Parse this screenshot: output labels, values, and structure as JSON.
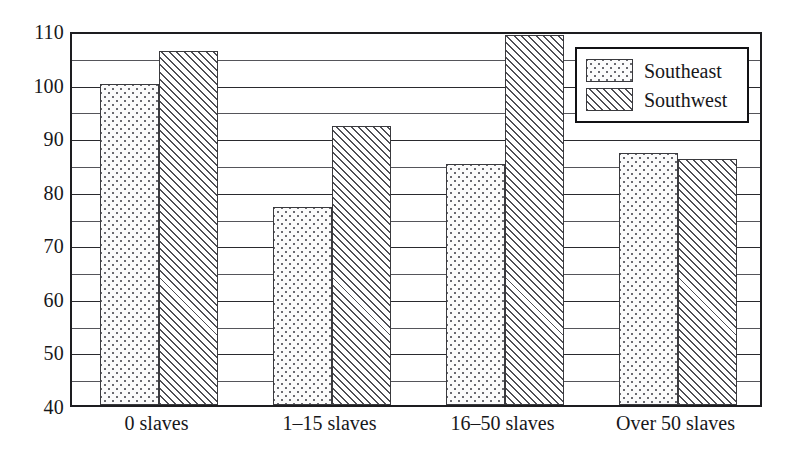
{
  "chart_data": {
    "type": "bar",
    "title": "",
    "subtitle": "",
    "xlabel": "",
    "ylabel": "",
    "ylim": [
      40,
      110
    ],
    "y_major_ticks": [
      40,
      50,
      60,
      70,
      80,
      90,
      100,
      110
    ],
    "y_minor_ticks": [
      45,
      55,
      65,
      75,
      85,
      95,
      105
    ],
    "y_tick_labels": [
      "40",
      "50",
      "60",
      "70",
      "80",
      "90",
      "100",
      "110"
    ],
    "grid": true,
    "legend_position": "top-right",
    "categories": [
      "0 slaves",
      "1–15 slaves",
      "16–50 slaves",
      "Over 50 slaves"
    ],
    "series": [
      {
        "name": "Southeast",
        "pattern": "dotted",
        "values": [
          100,
          77,
          85,
          87
        ]
      },
      {
        "name": "Southwest",
        "pattern": "diagonal-hatch",
        "values": [
          106,
          92,
          109,
          86
        ]
      }
    ]
  },
  "legend": {
    "entries": [
      {
        "label": "Southeast",
        "swatch": "dotted-swatch"
      },
      {
        "label": "Southwest",
        "swatch": "hatched-swatch"
      }
    ]
  },
  "colors": {
    "frame": "#1d1d20",
    "gridline": "#55555a",
    "text": "#17171a",
    "bar_outline": "#3a3a3e",
    "background": "#ffffff"
  }
}
